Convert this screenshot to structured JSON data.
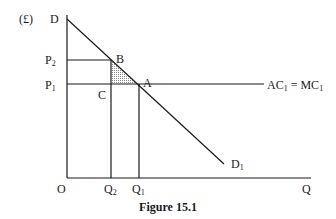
{
  "figure": {
    "caption": "Figure 15.1",
    "y_axis_unit": "(£)",
    "y_axis_top_label": "D",
    "x_axis_label": "Q",
    "origin_label": "O",
    "price_labels": [
      {
        "base": "P",
        "sub": "2"
      },
      {
        "base": "P",
        "sub": "1"
      }
    ],
    "quantity_labels": [
      {
        "base": "Q",
        "sub": "2"
      },
      {
        "base": "Q",
        "sub": "1"
      }
    ],
    "points": {
      "B": "B",
      "A": "A",
      "C": "C"
    },
    "demand_end_label": {
      "base": "D",
      "sub": "1"
    },
    "cost_line_label": {
      "ac": "AC",
      "ac_sub": "1",
      "eq": " = ",
      "mc": "MC",
      "mc_sub": "1"
    },
    "shaded_region": "triangle ABC (deadweight loss)",
    "colors": {
      "line": "#1a1a1a",
      "shade": "#bdbdbd"
    }
  }
}
